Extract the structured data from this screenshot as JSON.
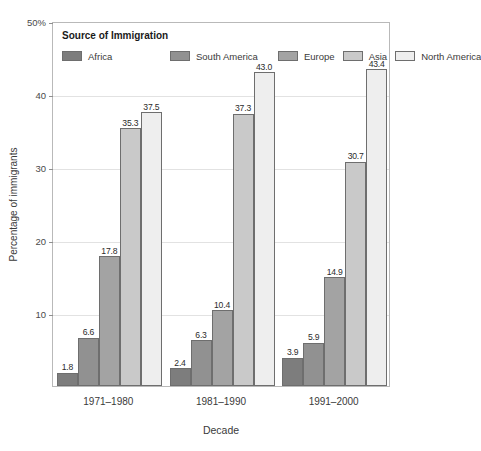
{
  "chart_data": {
    "type": "bar",
    "title": "",
    "xlabel": "Decade",
    "ylabel": "Percentage of immigrants",
    "categories": [
      "1971–1980",
      "1981–1990",
      "1991–2000"
    ],
    "series": [
      {
        "name": "Africa",
        "color": "#7d7d7d",
        "values": [
          1.8,
          2.4,
          3.9
        ]
      },
      {
        "name": "South America",
        "color": "#919191",
        "values": [
          6.6,
          6.3,
          5.9
        ]
      },
      {
        "name": "Europe",
        "color": "#a3a3a3",
        "values": [
          17.8,
          10.4,
          14.9
        ]
      },
      {
        "name": "Asia",
        "color": "#c9c9c9",
        "values": [
          35.3,
          37.3,
          30.7
        ]
      },
      {
        "name": "North America",
        "color": "#eeeeee",
        "values": [
          37.5,
          43.0,
          43.4
        ]
      }
    ],
    "ylim": [
      0,
      50
    ],
    "yticks": [
      10,
      20,
      30,
      40,
      50
    ],
    "ytick_labels": [
      "10",
      "20",
      "30",
      "40",
      "50%"
    ],
    "grid": true,
    "legend_position": "inside-top-left",
    "legend_title": "Source of Immigration",
    "data_labels": [
      [
        "1.8",
        "6.6",
        "17.8",
        "35.3",
        "37.5"
      ],
      [
        "2.4",
        "6.3",
        "10.4",
        "37.3",
        "43.0"
      ],
      [
        "3.9",
        "5.9",
        "14.9",
        "30.7",
        "43.4"
      ]
    ]
  }
}
